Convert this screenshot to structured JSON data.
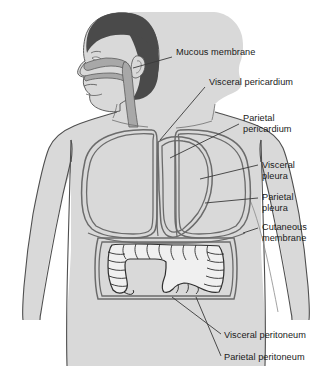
{
  "figure": {
    "background_color": "#ffffff",
    "colors": {
      "body_fill": "#d9d9d9",
      "body_outline": "#4f4f4f",
      "hair_fill": "#4a4a4a",
      "airway_fill": "#a8a8a8",
      "airway_outline": "#5a5a5a",
      "membrane_line": "#6b6b6b",
      "organ_fill": "#f0f0f0",
      "organ_outline": "#2f2f2f",
      "leader_line": "#3a3a3a",
      "text": "#1a1a1a"
    }
  },
  "labels": [
    {
      "id": "mucous-membrane",
      "text": "Mucous membrane",
      "lines": [
        "Mucous membrane"
      ],
      "x": 176,
      "y": 47,
      "leader": {
        "x1": 172,
        "y1": 57,
        "x2": 133,
        "y2": 68
      }
    },
    {
      "id": "visceral-pericardium",
      "text": "Visceral pericardium",
      "lines": [
        "Visceral pericardium"
      ],
      "x": 209,
      "y": 77,
      "leader": {
        "x1": 205,
        "y1": 87,
        "x2": 160,
        "y2": 140
      }
    },
    {
      "id": "parietal-pericardium",
      "text": "Parietal pericardium",
      "lines": [
        "Parietal",
        "pericardium"
      ],
      "x": 243,
      "y": 113,
      "leader": {
        "x1": 239,
        "y1": 124,
        "x2": 170,
        "y2": 158
      }
    },
    {
      "id": "visceral-pleura",
      "text": "Visceral pleura",
      "lines": [
        "Visceral",
        "pleura"
      ],
      "x": 262,
      "y": 160,
      "leader": {
        "x1": 258,
        "y1": 165,
        "x2": 200,
        "y2": 179
      }
    },
    {
      "id": "parietal-pleura",
      "text": "Parietal pleura",
      "lines": [
        "Parietal",
        "pleura"
      ],
      "x": 262,
      "y": 192,
      "leader": {
        "x1": 258,
        "y1": 198,
        "x2": 205,
        "y2": 203
      }
    },
    {
      "id": "cutaneous-membrane",
      "text": "Cutaneous membrane",
      "lines": [
        "Cutaneous",
        "membrane"
      ],
      "x": 262,
      "y": 222,
      "leader": {
        "x1": 258,
        "y1": 228,
        "x2": 243,
        "y2": 233
      }
    },
    {
      "id": "visceral-peritoneum",
      "text": "Visceral peritoneum",
      "lines": [
        "Visceral peritoneum"
      ],
      "x": 224,
      "y": 330,
      "leader": {
        "x1": 221,
        "y1": 334,
        "x2": 172,
        "y2": 297
      }
    },
    {
      "id": "parietal-peritoneum",
      "text": "Parietal peritoneum",
      "lines": [
        "Parietal peritoneum"
      ],
      "x": 224,
      "y": 352,
      "leader": {
        "x1": 221,
        "y1": 356,
        "x2": 196,
        "y2": 297
      }
    }
  ]
}
